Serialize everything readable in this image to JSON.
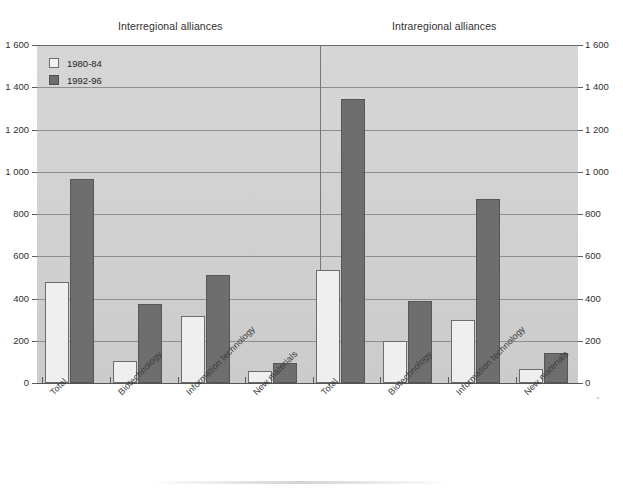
{
  "chart_data": {
    "type": "bar",
    "title": "",
    "subtitle": "",
    "xlabel": "",
    "ylabel": "",
    "ylim": [
      0,
      1600
    ],
    "ytick_step": 200,
    "ytick_labels": [
      "1 600",
      "1 400",
      "1 200",
      "1 000",
      "800",
      "600",
      "400",
      "200",
      "0"
    ],
    "ytick_values": [
      1600,
      1400,
      1200,
      1000,
      800,
      600,
      400,
      200,
      0
    ],
    "grid": true,
    "legend_position": "top-left",
    "dual_axis": true,
    "panels": [
      {
        "name": "Interregional alliances",
        "categories": [
          "Total",
          "Biotechnology",
          "Information technology",
          "New materials"
        ],
        "series": [
          {
            "name": "1980-84",
            "values": [
              480,
              105,
              315,
              55
            ]
          },
          {
            "name": "1992-96",
            "values": [
              965,
              375,
              510,
              95
            ]
          }
        ]
      },
      {
        "name": "Intraregional alliances",
        "categories": [
          "Total",
          "Biotechnology",
          "Information technology",
          "New materials"
        ],
        "series": [
          {
            "name": "1980-84",
            "values": [
              535,
              200,
              300,
              65
            ]
          },
          {
            "name": "1992-96",
            "values": [
              1345,
              390,
              870,
              140
            ]
          }
        ]
      }
    ],
    "colors": {
      "series_1980_84": "#efefef",
      "series_1992_96": "#6e6e6e",
      "plot_background": "#d2d2d2",
      "gridline": "#8e8e8e",
      "text": "#2f2f2f"
    }
  },
  "legend": {
    "items": [
      {
        "label": "1980-84",
        "key": "series_1980_84"
      },
      {
        "label": "1992-96",
        "key": "series_1992_96"
      }
    ]
  },
  "panel_titles": {
    "left": "Interregional alliances",
    "right": "Intraregional alliances"
  },
  "icons": {
    "legend_swatch_light": "square-outline-icon",
    "legend_swatch_dark": "square-filled-icon"
  }
}
